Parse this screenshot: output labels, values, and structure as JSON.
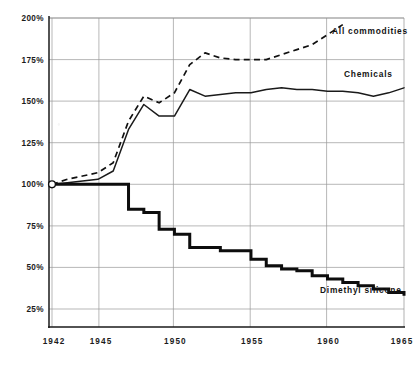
{
  "chart_data": {
    "type": "line",
    "title": "",
    "subtitle": "",
    "xlabel": "",
    "ylabel": "",
    "xlim": [
      1941.8,
      1965.2
    ],
    "ylim": [
      0,
      200
    ],
    "grid": true,
    "legend_position": "inline-right",
    "x_ticks": [
      "1942",
      "1945",
      "1950",
      "1955",
      "1960",
      "1965"
    ],
    "x_tick_values": [
      1942,
      1945,
      1950,
      1955,
      1960,
      1965
    ],
    "y_ticks": [
      "25%",
      "50%",
      "75%",
      "100%",
      "125%",
      "150%",
      "175%",
      "200%"
    ],
    "y_tick_values": [
      25,
      50,
      75,
      100,
      125,
      150,
      175,
      200
    ],
    "annotations": [
      {
        "name": "origin-marker",
        "x": 1942,
        "y": 100,
        "style": "open-circle"
      }
    ],
    "series": [
      {
        "name": "All commodities",
        "style": "dashed",
        "x": [
          1942,
          1943,
          1944,
          1945,
          1946,
          1947,
          1948,
          1949,
          1950,
          1951,
          1952,
          1953,
          1954,
          1955,
          1956,
          1957,
          1958,
          1959,
          1960,
          1961
        ],
        "values": [
          100,
          103,
          105,
          107,
          113,
          138,
          153,
          149,
          155,
          172,
          179,
          176,
          175,
          175,
          175,
          178,
          181,
          184,
          190,
          196
        ]
      },
      {
        "name": "Chemicals",
        "style": "solid-thin",
        "x": [
          1942,
          1943,
          1944,
          1945,
          1946,
          1947,
          1948,
          1949,
          1950,
          1951,
          1952,
          1953,
          1954,
          1955,
          1956,
          1957,
          1958,
          1959,
          1960,
          1961,
          1962,
          1963,
          1964,
          1965
        ],
        "values": [
          100,
          101,
          102,
          103,
          108,
          133,
          148,
          141,
          141,
          157,
          153,
          154,
          155,
          155,
          157,
          158,
          157,
          157,
          156,
          156,
          155,
          153,
          155,
          158
        ]
      },
      {
        "name": "Dimethyl silicone",
        "style": "solid-thick-step",
        "x": [
          1942,
          1946,
          1947,
          1948,
          1949,
          1950,
          1951,
          1953,
          1955,
          1956,
          1957,
          1958,
          1959,
          1960,
          1961,
          1962,
          1963,
          1964,
          1965
        ],
        "values": [
          100,
          100,
          85,
          83,
          73,
          70,
          62,
          60,
          55,
          51,
          49,
          48,
          45,
          43,
          41,
          39,
          37,
          35,
          33
        ]
      }
    ]
  },
  "labels": {
    "all_commodities": "All commodities",
    "chemicals": "Chemicals",
    "dimethyl_silicone": "Dimethyl silicone"
  },
  "y_axis": {
    "t200": "200%",
    "t175": "175%",
    "t150": "150%",
    "t125": "125%",
    "t100": "100%",
    "t75": "75%",
    "t50": "50%",
    "t25": "25%"
  },
  "x_axis": {
    "t1942": "1942",
    "t1945": "1945",
    "t1950": "1950",
    "t1955": "1955",
    "t1960": "1960",
    "t1965": "1965"
  },
  "colors": {
    "ink": "#141414",
    "grid": "#9a9a9a",
    "paper": "#ffffff"
  }
}
